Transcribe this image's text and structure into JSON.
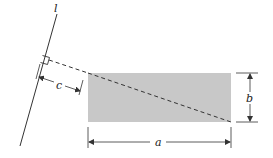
{
  "diagram": {
    "line_label": "l",
    "dimension_labels": {
      "width": "a",
      "height": "b",
      "offset": "c"
    },
    "colors": {
      "rectangle_fill": "#c8c8c8",
      "stroke": "#333333"
    }
  }
}
